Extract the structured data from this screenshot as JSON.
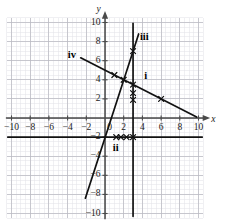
{
  "figure": {
    "type": "coordinate-grid-graph",
    "background": "#ffffff",
    "grid": {
      "minor_step": 0.5,
      "major_step": 2,
      "minor_color": "#e2e2e8",
      "major_color": "#b9b9c2",
      "xrange": [
        -10.5,
        10.5
      ],
      "yrange": [
        -10.5,
        10.5
      ],
      "visible": true
    },
    "axes": {
      "line_color": "#4a4a4a",
      "x_axis_name": "x",
      "y_axis_name": "y",
      "x_ticks": [
        -10,
        -8,
        -6,
        -4,
        -2,
        0,
        2,
        4,
        6,
        8,
        10
      ],
      "y_ticks": [
        10,
        8,
        6,
        4,
        2,
        -2,
        -4,
        -6,
        -8,
        -10
      ],
      "x_tick_labels": [
        "-10",
        "-8",
        "-6",
        "-4",
        "-2",
        "0",
        "2",
        "4",
        "6",
        "8",
        "10"
      ],
      "y_tick_labels": [
        "10",
        "8",
        "6",
        "4",
        "2",
        "-2",
        "-4",
        "-6",
        "-8",
        "-10"
      ]
    },
    "lines": [
      {
        "id": "i",
        "label": "i",
        "label_xy": [
          4.35,
          4.45
        ],
        "description": "descending line through (0,5) slope -1/2",
        "color": "#111111",
        "width": 1.7,
        "from": [
          -2.6,
          6.3
        ],
        "to": [
          9.8,
          0.1
        ],
        "markers": [
          [
            1,
            4.5
          ],
          [
            2,
            4.0
          ],
          [
            3,
            3.5
          ],
          [
            3,
            2.6
          ],
          [
            3,
            1.9
          ],
          [
            6,
            2.0
          ]
        ]
      },
      {
        "id": "ii",
        "label": "ii",
        "label_xy": [
          1.15,
          -3.15
        ],
        "description": "horizontal line y = -2",
        "color": "#111111",
        "width": 1.7,
        "from": [
          -10.4,
          -2
        ],
        "to": [
          10.4,
          -2
        ],
        "markers": [
          [
            1.2,
            -2
          ],
          [
            1.7,
            -2
          ],
          [
            2.3,
            -2
          ],
          [
            3,
            -2
          ]
        ]
      },
      {
        "id": "iii",
        "label": "iii",
        "label_xy": [
          4.2,
          8.45
        ],
        "description": "vertical line x = 3",
        "color": "#111111",
        "width": 1.7,
        "from": [
          3,
          -10.3
        ],
        "to": [
          3,
          9.9
        ],
        "markers": []
      },
      {
        "id": "iv",
        "label": "iv",
        "label_xy": [
          -3.55,
          6.55
        ],
        "description": "steep ascending line slope 3 through (0,-2)",
        "color": "#111111",
        "width": 1.7,
        "from": [
          -2.1,
          -8.4
        ],
        "to": [
          3.6,
          8.8
        ],
        "markers": [
          [
            3,
            7.0
          ]
        ]
      }
    ],
    "marker_symbol": "x-cross",
    "marker_color": "#111111"
  },
  "chart_data": {
    "type": "line",
    "title": "",
    "xlabel": "x",
    "ylabel": "y",
    "xlim": [
      -10.5,
      10.5
    ],
    "ylim": [
      -10.5,
      10.5
    ],
    "grid": true,
    "legend": "inline-labels",
    "series": [
      {
        "name": "i",
        "equation": "y = -0.5x + 5",
        "x": [
          -2.6,
          9.8
        ],
        "y": [
          6.3,
          0.1
        ],
        "points": [
          [
            1,
            4.5
          ],
          [
            2,
            4.0
          ],
          [
            3,
            3.5
          ],
          [
            3,
            2.6
          ],
          [
            3,
            1.9
          ],
          [
            6,
            2.0
          ]
        ]
      },
      {
        "name": "ii",
        "equation": "y = -2",
        "x": [
          -10.4,
          10.4
        ],
        "y": [
          -2,
          -2
        ],
        "points": [
          [
            1.2,
            -2
          ],
          [
            1.7,
            -2
          ],
          [
            2.3,
            -2
          ],
          [
            3,
            -2
          ]
        ]
      },
      {
        "name": "iii",
        "equation": "x = 3",
        "x": [
          3,
          3
        ],
        "y": [
          -10.3,
          9.9
        ],
        "points": []
      },
      {
        "name": "iv",
        "equation": "y = 3x - 2",
        "x": [
          -2.1,
          3.6
        ],
        "y": [
          -8.4,
          8.8
        ],
        "points": [
          [
            3,
            7.0
          ]
        ]
      }
    ]
  }
}
